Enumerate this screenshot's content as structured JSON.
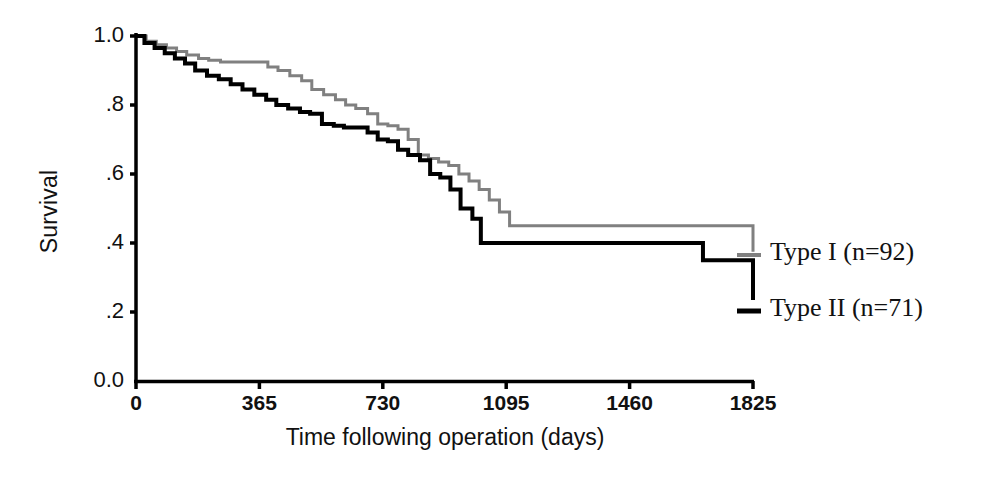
{
  "chart_data": {
    "type": "line",
    "title": "",
    "subtitle": "",
    "xlabel": "Time following operation (days)",
    "ylabel": "Survival",
    "xlim": [
      0,
      1825
    ],
    "ylim": [
      0.0,
      1.0
    ],
    "xticks": [
      "0",
      "365",
      "730",
      "1095",
      "1460",
      "1825"
    ],
    "xtick_values": [
      0,
      365,
      730,
      1095,
      1460,
      1825
    ],
    "yticks": [
      "0.0",
      ".2",
      ".4",
      ".6",
      ".8",
      "1.0"
    ],
    "ytick_values": [
      0.0,
      0.2,
      0.4,
      0.6,
      0.8,
      1.0
    ],
    "grid": false,
    "legend_position": "right",
    "step_style": "post",
    "annotations": [],
    "series": [
      {
        "name": "Type I (n=92)",
        "label": "Type I (n=92)",
        "n": 92,
        "color": "#808080",
        "linewidth": 3,
        "final_survival": 0.375,
        "x": [
          0,
          30,
          60,
          90,
          120,
          150,
          185,
          215,
          250,
          285,
          320,
          355,
          390,
          420,
          455,
          490,
          520,
          555,
          590,
          620,
          650,
          685,
          715,
          745,
          775,
          805,
          835,
          865,
          895,
          925,
          955,
          985,
          1015,
          1045,
          1075,
          1105,
          1677,
          1825
        ],
        "y": [
          1.0,
          0.985,
          0.975,
          0.965,
          0.955,
          0.945,
          0.935,
          0.93,
          0.925,
          0.925,
          0.925,
          0.925,
          0.91,
          0.9,
          0.885,
          0.87,
          0.845,
          0.83,
          0.815,
          0.8,
          0.79,
          0.775,
          0.745,
          0.74,
          0.73,
          0.7,
          0.655,
          0.645,
          0.635,
          0.625,
          0.6,
          0.58,
          0.555,
          0.525,
          0.49,
          0.45,
          0.45,
          0.375
        ]
      },
      {
        "name": "Type II (n=71)",
        "label": "Type II (n=71)",
        "n": 71,
        "color": "#000000",
        "linewidth": 4,
        "final_survival": 0.235,
        "x": [
          0,
          25,
          55,
          85,
          115,
          145,
          175,
          210,
          245,
          280,
          315,
          350,
          385,
          415,
          450,
          485,
          515,
          550,
          585,
          615,
          650,
          685,
          715,
          745,
          775,
          805,
          840,
          870,
          900,
          930,
          960,
          995,
          1020,
          1485,
          1677,
          1825
        ],
        "y": [
          1.0,
          0.98,
          0.965,
          0.95,
          0.935,
          0.92,
          0.9,
          0.885,
          0.875,
          0.86,
          0.845,
          0.83,
          0.815,
          0.8,
          0.79,
          0.78,
          0.775,
          0.745,
          0.74,
          0.735,
          0.735,
          0.72,
          0.7,
          0.695,
          0.67,
          0.655,
          0.64,
          0.6,
          0.59,
          0.555,
          0.5,
          0.47,
          0.4,
          0.4,
          0.35,
          0.235
        ]
      }
    ]
  },
  "axes": {
    "axis_color": "#000000",
    "axis_width": 3
  }
}
